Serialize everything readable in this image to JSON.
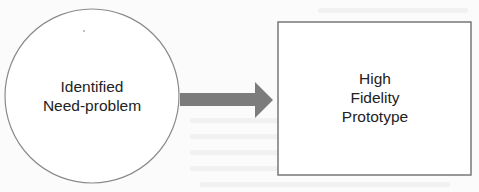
{
  "diagram": {
    "type": "flow",
    "nodes": [
      {
        "id": "need",
        "shape": "circle",
        "lines": [
          "Identified",
          "Need-problem"
        ]
      },
      {
        "id": "prototype",
        "shape": "rectangle",
        "lines": [
          "High",
          "Fidelity",
          "Prototype"
        ]
      }
    ],
    "edges": [
      {
        "from": "need",
        "to": "prototype",
        "style": "block-arrow"
      }
    ],
    "colors": {
      "background": "#fbfbfb",
      "outline": "#8a8a8a",
      "arrow": "#7c7c7c",
      "text": "#222222"
    }
  }
}
